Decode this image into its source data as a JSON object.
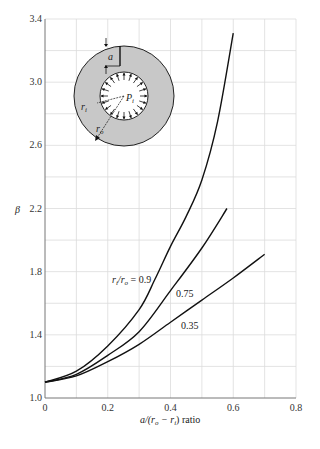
{
  "chart_data": {
    "type": "line",
    "title": "",
    "xlabel": "a/(r_o − r_i) ratio",
    "ylabel": "β",
    "xlim": [
      0,
      0.8
    ],
    "ylim": [
      1.0,
      3.4
    ],
    "xticks": [
      "0",
      "0.2",
      "0.4",
      "0.6",
      "0.8"
    ],
    "yticks": [
      "1.0",
      "1.4",
      "1.8",
      "2.2",
      "2.6",
      "3.0",
      "3.4"
    ],
    "grid": true,
    "grid_x_step": 0.1,
    "grid_y_step": 0.2,
    "legend": "inline labels on curves",
    "series": [
      {
        "name": "r_i/r_o = 0.9",
        "label": "= 0.9",
        "x": [
          0,
          0.1,
          0.2,
          0.3,
          0.35,
          0.4,
          0.45,
          0.5,
          0.55,
          0.6
        ],
        "values": [
          1.1,
          1.17,
          1.33,
          1.56,
          1.75,
          1.96,
          2.15,
          2.38,
          2.75,
          3.31
        ]
      },
      {
        "name": "r_i/r_o = 0.75",
        "label": "0.75",
        "x": [
          0,
          0.1,
          0.2,
          0.3,
          0.4,
          0.5,
          0.58
        ],
        "values": [
          1.1,
          1.15,
          1.27,
          1.42,
          1.68,
          1.95,
          2.2
        ]
      },
      {
        "name": "r_i/r_o = 0.35",
        "label": "0.35",
        "x": [
          0,
          0.1,
          0.2,
          0.3,
          0.4,
          0.5,
          0.6,
          0.7
        ],
        "values": [
          1.1,
          1.14,
          1.23,
          1.34,
          1.48,
          1.62,
          1.76,
          1.91
        ]
      }
    ],
    "inset": {
      "description": "Thick-walled ring with radial crack of depth a under internal pressure",
      "labels": [
        "a",
        "P_i",
        "r_i",
        "r_o"
      ]
    }
  },
  "labels": {
    "y_symbol": "β",
    "x_axis": "a/(r",
    "x_axis_o": "o",
    "x_axis_mid": " − r",
    "x_axis_i": "i",
    "x_axis_end": ") ratio",
    "curve09_r": "r",
    "curve09_i": "i",
    "curve09_slash": "/r",
    "curve09_o": "o",
    "curve09_eq": " = 0.9",
    "curve075": "0.75",
    "curve035": "0.35",
    "inset_a": "a",
    "inset_P": "P",
    "inset_P_sub": "i",
    "inset_ri": "r",
    "inset_ri_sub": "i",
    "inset_ro": "r",
    "inset_ro_sub": "o"
  }
}
